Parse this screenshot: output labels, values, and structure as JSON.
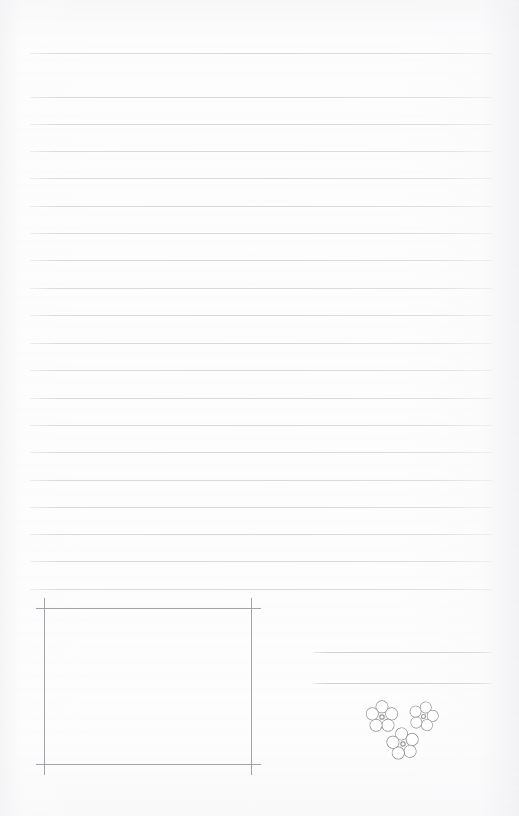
{
  "page": {
    "width": 519,
    "height": 816,
    "background_color": "#fdfdfd",
    "paper_tone_color": "#f3f3f5",
    "kind": "blank lined notepaper scan"
  },
  "ruled_lines": {
    "name": "ruled-writing-lines",
    "color": "#d9dbde",
    "thickness_px": 1,
    "x_start": 30,
    "x_end": 492,
    "count": 19,
    "first_gap_px": 44,
    "spacing_px": 27.3,
    "y_positions": [
      53,
      97,
      124,
      151,
      178,
      206,
      233,
      260,
      288,
      315,
      343,
      370,
      398,
      425,
      452,
      480,
      507,
      534,
      561,
      589
    ]
  },
  "short_rules": {
    "name": "right-side-short-rules",
    "color": "#cdcfd4",
    "thickness_px": 1,
    "x_start": 313,
    "x_end": 492,
    "count": 2,
    "y_positions": [
      652,
      683
    ]
  },
  "framed_box": {
    "name": "bottom-left-framed-box",
    "color": "#9b9b9f",
    "thickness_px": 1,
    "left": 44,
    "right": 251,
    "top": 608,
    "bottom": 764,
    "width": 207,
    "height": 156,
    "horizontal_overhang_left": 36,
    "horizontal_overhang_right": 261,
    "vertical_overhang_top": 598,
    "vertical_overhang_bottom": 775,
    "style": "crop-mark corners, lines extend past the intersections"
  },
  "flowers": {
    "name": "flower-doodle-cluster",
    "outline_color": "#8e8e92",
    "center_dot_color": "#9a9a9e",
    "fill_color": "#ffffff",
    "count": 3,
    "petal_count": 5,
    "items": [
      {
        "label": "flower-left",
        "cx": 382,
        "cy": 717,
        "size": 34,
        "rotation_deg": 0
      },
      {
        "label": "flower-right",
        "cx": 423,
        "cy": 716,
        "size": 31,
        "rotation_deg": 14
      },
      {
        "label": "flower-bottom",
        "cx": 403,
        "cy": 744,
        "size": 34,
        "rotation_deg": -8
      }
    ]
  }
}
